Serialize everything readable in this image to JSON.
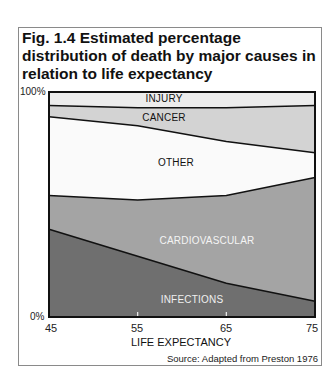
{
  "figure": {
    "title": "Fig. 1.4  Estimated percentage distribution of death by major causes in relation to life expectancy",
    "y_top_label": "100%",
    "y_bottom_label": "0%",
    "x_ticks": [
      "45",
      "55",
      "65",
      "75"
    ],
    "xlabel": "LIFE EXPECTANCY",
    "source": "Source: Adapted from Preston 1976"
  },
  "colors": {
    "injury": "#ececec",
    "cancer": "#d3d3d3",
    "other": "#fafafa",
    "cardiovascular": "#a4a4a4",
    "infections": "#6f6f6f",
    "line": "#111111"
  },
  "chart_data": {
    "type": "area",
    "stacked": true,
    "normalized_percent": true,
    "title": "Fig. 1.4  Estimated percentage distribution of death by major causes in relation to life expectancy",
    "xlabel": "LIFE EXPECTANCY",
    "ylabel": "",
    "x": [
      45,
      55,
      65,
      75
    ],
    "xlim": [
      45,
      75
    ],
    "ylim": [
      0,
      100
    ],
    "y_tick_labels": [
      "0%",
      "100%"
    ],
    "x_tick_labels": [
      "45",
      "55",
      "65",
      "75"
    ],
    "grid": false,
    "legend": "inline labels",
    "series": [
      {
        "name": "INFECTIONS",
        "values": [
          39,
          27,
          15,
          7
        ]
      },
      {
        "name": "CARDIOVASCULAR",
        "values": [
          15,
          25,
          39,
          55
        ]
      },
      {
        "name": "OTHER",
        "values": [
          35,
          33,
          24,
          11
        ]
      },
      {
        "name": "CANCER",
        "values": [
          5,
          8,
          15,
          21
        ]
      },
      {
        "name": "INJURY",
        "values": [
          6,
          7,
          7,
          6
        ]
      }
    ],
    "annotations": [
      "Source: Adapted from Preston 1976"
    ]
  }
}
